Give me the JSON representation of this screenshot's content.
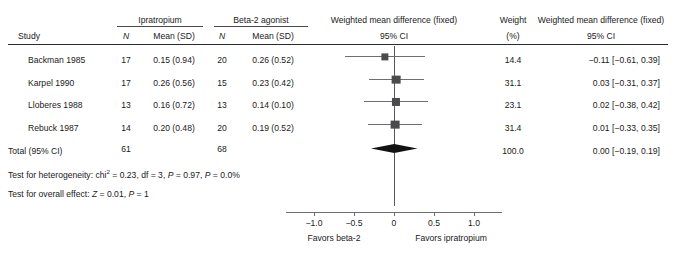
{
  "chart_data": {
    "type": "forest",
    "title": "",
    "xlabel": "Weighted mean difference (fixed) 95% CI",
    "xlim": [
      -1.35,
      1.35
    ],
    "xticks": [
      -1.0,
      -0.5,
      0,
      0.5,
      1.0
    ],
    "xticklabels": [
      "−1.0",
      "−0.5",
      "0",
      "0.5",
      "1.0"
    ],
    "null_line": 0,
    "left_favors": "Favors beta-2",
    "right_favors": "Favors ipratropium",
    "group_left": "Ipratropium",
    "group_right": "Beta-2 agonist",
    "studies": [
      {
        "study": "Backman 1985",
        "n1": "17",
        "mean1": "0.15 (0.94)",
        "n2": "20",
        "mean2": "0.26 (0.52)",
        "weight": "14.4",
        "weight_value": 14.4,
        "effect": -0.11,
        "lower": -0.61,
        "upper": 0.39,
        "effect_text": "−0.11 [−0.61, 0.39]"
      },
      {
        "study": "Karpel 1990",
        "n1": "17",
        "mean1": "0.26 (0.56)",
        "n2": "15",
        "mean2": "0.23 (0.42)",
        "weight": "31.1",
        "weight_value": 31.1,
        "effect": 0.03,
        "lower": -0.31,
        "upper": 0.37,
        "effect_text": "0.03 [−0.31, 0.37]"
      },
      {
        "study": "Lloberes 1988",
        "n1": "13",
        "mean1": "0.16 (0.72)",
        "n2": "13",
        "mean2": "0.14 (0.10)",
        "weight": "23.1",
        "weight_value": 23.1,
        "effect": 0.02,
        "lower": -0.38,
        "upper": 0.42,
        "effect_text": "0.02 [−0.38, 0.42]"
      },
      {
        "study": "Rebuck 1987",
        "n1": "14",
        "mean1": "0.20 (0.48)",
        "n2": "20",
        "mean2": "0.19 (0.52)",
        "weight": "31.4",
        "weight_value": 31.4,
        "effect": 0.01,
        "lower": -0.33,
        "upper": 0.35,
        "effect_text": "0.01 [−0.33, 0.35]"
      }
    ],
    "total": {
      "label": "Total (95% CI)",
      "n1": "61",
      "n2": "68",
      "weight": "100.0",
      "effect": 0.0,
      "lower": -0.19,
      "upper": 0.19,
      "effect_text": "0.00 [−0.19, 0.19]"
    }
  },
  "header": {
    "study": "Study",
    "group_left": "Ipratropium",
    "group_right": "Beta-2 agonist",
    "n_left": "N",
    "mean_left": "Mean (SD)",
    "n_right": "N",
    "mean_right": "Mean (SD)",
    "wmd_plot_line1": "Weighted mean difference (fixed)",
    "wmd_plot_line2": "95% CI",
    "weight_line1": "Weight",
    "weight_line2": "(%)",
    "wmd_text_line1": "Weighted mean difference (fixed)",
    "wmd_text_line2": "95% CI"
  },
  "rows": [
    {
      "study": "Backman 1985",
      "n1": "17",
      "mean1": "0.15 (0.94)",
      "n2": "20",
      "mean2": "0.26 (0.52)",
      "weight": "14.4",
      "effect_text": "−0.11 [−0.61, 0.39]"
    },
    {
      "study": "Karpel 1990",
      "n1": "17",
      "mean1": "0.26 (0.56)",
      "n2": "15",
      "mean2": "0.23 (0.42)",
      "weight": "31.1",
      "effect_text": "0.03 [−0.31, 0.37]"
    },
    {
      "study": "Lloberes 1988",
      "n1": "13",
      "mean1": "0.16 (0.72)",
      "n2": "13",
      "mean2": "0.14 (0.10)",
      "weight": "23.1",
      "effect_text": "0.02 [−0.38, 0.42]"
    },
    {
      "study": "Rebuck 1987",
      "n1": "14",
      "mean1": "0.20 (0.48)",
      "n2": "20",
      "mean2": "0.19 (0.52)",
      "weight": "31.4",
      "effect_text": "0.01 [−0.33, 0.35]"
    }
  ],
  "total_row": {
    "label": "Total (95% CI)",
    "n1": "61",
    "n2": "68",
    "weight": "100.0",
    "effect_text": "0.00 [−0.19, 0.19]"
  },
  "stats": {
    "heterogeneity_prefix": "Test for heterogeneity: chi",
    "heterogeneity_sup": "2",
    "heterogeneity_rest_a": " = 0.23, df = 3, ",
    "het_p1_symbol": "P",
    "het_p1_value": " = 0.97, ",
    "het_p2_symbol": "P",
    "het_p2_value": " = 0.0%",
    "overall_prefix": "Test for overall effect: ",
    "overall_z_symbol": "Z",
    "overall_z_value": " = 0.01, ",
    "overall_p_symbol": "P",
    "overall_p_value": " = 1"
  },
  "axis": {
    "labels": [
      "−1.0",
      "−0.5",
      "0",
      "0.5",
      "1.0"
    ],
    "favors_left": "Favors beta-2",
    "favors_right": "Favors ipratropium"
  },
  "colors": {
    "text": "#1a1a1a",
    "rule": "#2b2b2b",
    "marker": "#4b4b4d",
    "ci": "#6e6e70",
    "diamond": "#121212"
  }
}
